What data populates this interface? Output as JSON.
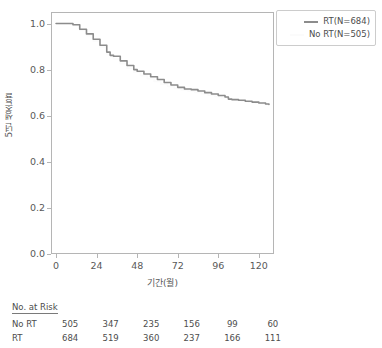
{
  "chart_data": {
    "type": "line",
    "title": "",
    "xlabel": "기간(월)",
    "ylabel": "5년 생존율",
    "xlim": [
      -3,
      129
    ],
    "ylim": [
      0.0,
      1.05
    ],
    "xticks": [
      0,
      24,
      48,
      72,
      96,
      120
    ],
    "yticks": [
      "0.0",
      "0.2",
      "0.4",
      "0.6",
      "0.8",
      "1.0"
    ],
    "grid": false,
    "legend_position": "upper right",
    "series": [
      {
        "name": "RT(N=684)",
        "color": "#8c8c8c",
        "x": [
          0,
          4,
          8,
          10,
          14,
          18,
          22,
          26,
          30,
          32,
          34,
          38,
          42,
          46,
          48,
          52,
          56,
          60,
          64,
          68,
          72,
          76,
          80,
          84,
          88,
          92,
          96,
          100,
          102,
          104,
          108,
          112,
          116,
          120,
          124,
          126
        ],
        "y": [
          1.0,
          1.0,
          1.0,
          0.995,
          0.975,
          0.955,
          0.932,
          0.906,
          0.876,
          0.862,
          0.858,
          0.838,
          0.818,
          0.8,
          0.793,
          0.781,
          0.769,
          0.757,
          0.744,
          0.733,
          0.723,
          0.716,
          0.713,
          0.707,
          0.7,
          0.694,
          0.688,
          0.681,
          0.672,
          0.67,
          0.667,
          0.663,
          0.659,
          0.655,
          0.651,
          0.649
        ]
      },
      {
        "name": "No RT(N=505)",
        "color": "#fbfbfb",
        "x": [
          0,
          4,
          8,
          10,
          14,
          18,
          22,
          26,
          30,
          34,
          38,
          42,
          46,
          50,
          54,
          58,
          62,
          66,
          70,
          74,
          78,
          82,
          86,
          90,
          94,
          98,
          102,
          106,
          110,
          114,
          118,
          122,
          126
        ],
        "y": [
          1.0,
          1.0,
          0.998,
          0.992,
          0.97,
          0.948,
          0.924,
          0.898,
          0.866,
          0.846,
          0.826,
          0.806,
          0.789,
          0.774,
          0.761,
          0.749,
          0.737,
          0.727,
          0.718,
          0.712,
          0.707,
          0.701,
          0.695,
          0.689,
          0.684,
          0.678,
          0.671,
          0.667,
          0.663,
          0.659,
          0.655,
          0.651,
          0.648
        ]
      }
    ]
  },
  "legend": {
    "items": [
      {
        "label": "RT(N=684)",
        "color": "#8c8c8c",
        "has_marker": true
      },
      {
        "label": "No RT(N=505)",
        "color": "#fbfbfb",
        "has_marker": false
      }
    ]
  },
  "risk_table": {
    "title": "No. at Risk",
    "columns": [
      0,
      24,
      48,
      72,
      96,
      120
    ],
    "rows": [
      {
        "label": "No RT",
        "values": [
          "505",
          "347",
          "235",
          "156",
          "99",
          "60"
        ]
      },
      {
        "label": "RT",
        "values": [
          "684",
          "519",
          "360",
          "237",
          "166",
          "111"
        ]
      }
    ]
  },
  "axes": {
    "y_label": "5년 생존율",
    "x_label": "기간(월)",
    "y_tick_labels": [
      "1.0",
      "0.8",
      "0.6",
      "0.4",
      "0.2",
      "0.0"
    ],
    "x_tick_labels": [
      "0",
      "24",
      "48",
      "72",
      "96",
      "120"
    ]
  }
}
